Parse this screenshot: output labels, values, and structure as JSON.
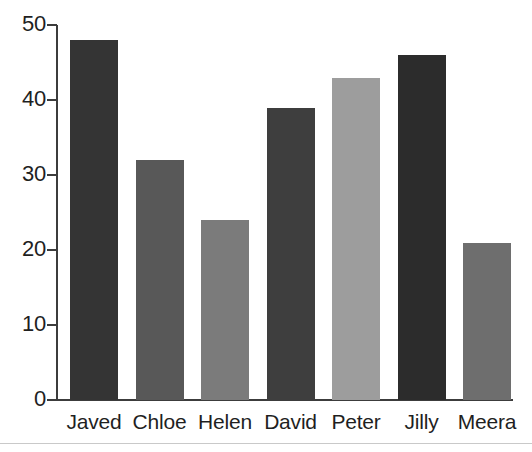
{
  "chart_data": {
    "type": "bar",
    "title": "",
    "subtitle": "",
    "xlabel": "",
    "ylabel": "",
    "categories": [
      "Javed",
      "Chloe",
      "Helen",
      "David",
      "Peter",
      "Jilly",
      "Meera"
    ],
    "values": [
      48,
      32,
      24,
      39,
      43,
      46,
      21
    ],
    "series": [
      {
        "name": "",
        "values": [
          48,
          32,
          24,
          39,
          43,
          46,
          21
        ]
      }
    ],
    "bar_colors": [
      "#343434",
      "#585858",
      "#7b7b7b",
      "#3e3e3e",
      "#9d9d9d",
      "#2c2c2c",
      "#6e6e6e"
    ],
    "ylim": [
      0,
      50
    ],
    "ytick_values": [
      0,
      10,
      20,
      30,
      40,
      50
    ],
    "ytick_labels": [
      "0",
      "10",
      "20",
      "30",
      "40",
      "50"
    ],
    "grid": false,
    "legend": false,
    "legend_position": "none",
    "axis_color": "#3c3c3c",
    "background_color": "#ffffff",
    "annotations": []
  }
}
